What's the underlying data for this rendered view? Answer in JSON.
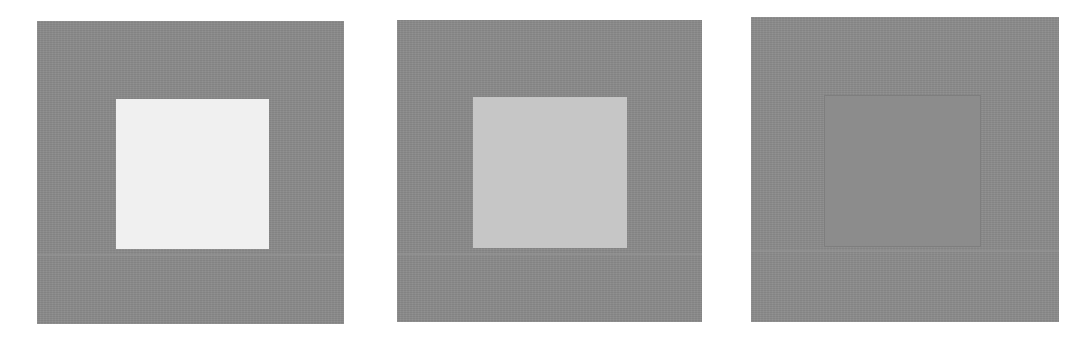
{
  "figure": {
    "background_color": "#ffffff",
    "panels": [
      {
        "id": "panel-1",
        "outer": {
          "x": 37,
          "y": 21,
          "width": 307,
          "height": 303,
          "color": "#8a8a8a"
        },
        "inner": {
          "x": 116,
          "y": 99,
          "width": 153,
          "height": 150,
          "color": "#f0f0f0",
          "border": "none"
        }
      },
      {
        "id": "panel-2",
        "outer": {
          "x": 397,
          "y": 20,
          "width": 305,
          "height": 302,
          "color": "#8a8a8a"
        },
        "inner": {
          "x": 473,
          "y": 97,
          "width": 154,
          "height": 151,
          "color": "#c6c6c6",
          "border": "none"
        }
      },
      {
        "id": "panel-3",
        "outer": {
          "x": 751,
          "y": 17,
          "width": 308,
          "height": 305,
          "color": "#8b8b8b"
        },
        "inner": {
          "x": 824,
          "y": 95,
          "width": 157,
          "height": 152,
          "color": "#8c8c8c",
          "border": "1px solid #7e7e7e"
        }
      }
    ]
  }
}
